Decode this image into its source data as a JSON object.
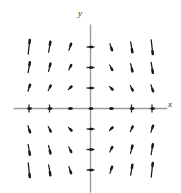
{
  "figure": {
    "kind": "direction-field",
    "background": "#ffffff",
    "axis_color": "#9a9a9a",
    "tick_color": "#2b2b2b",
    "arrow_color": "#1a1a1a"
  },
  "axes": {
    "x_label": "x",
    "y_label": "y",
    "x_label_position": "right-end-of-x-axis",
    "y_label_position": "top-of-y-axis"
  },
  "chart_data": {
    "type": "scatter",
    "title": "",
    "xlabel": "x",
    "ylabel": "y",
    "xlim": [
      -3.6,
      3.6
    ],
    "ylim": [
      -3.6,
      3.6
    ],
    "grid": false,
    "legend": null,
    "field_equation": "dy/dx = -x*y",
    "x": [
      -3,
      -2,
      -1,
      0,
      1,
      2,
      3
    ],
    "y": [
      3,
      2,
      1,
      0,
      -1,
      -2,
      -3
    ],
    "x_ticks": [
      -3,
      -2,
      -1,
      0,
      1,
      2,
      3
    ],
    "y_ticks": [
      -3,
      -2,
      -1,
      0,
      1,
      2,
      3
    ],
    "major_ticks_x": [
      -3,
      -2,
      2,
      3
    ],
    "minor_dot_ticks_x": [
      -1,
      0,
      1
    ],
    "major_ticks_y": [
      -3,
      -2,
      -1,
      1,
      2,
      3
    ],
    "vectors": [
      {
        "x": -3,
        "y": 3,
        "u": 1,
        "v": 9
      },
      {
        "x": -2,
        "y": 3,
        "u": 1,
        "v": 6
      },
      {
        "x": -1,
        "y": 3,
        "u": 1,
        "v": 3
      },
      {
        "x": 0,
        "y": 3,
        "u": 1,
        "v": 0
      },
      {
        "x": 1,
        "y": 3,
        "u": 1,
        "v": -3
      },
      {
        "x": 2,
        "y": 3,
        "u": 1,
        "v": -6
      },
      {
        "x": 3,
        "y": 3,
        "u": 1,
        "v": -9
      },
      {
        "x": -3,
        "y": 2,
        "u": 1,
        "v": 6
      },
      {
        "x": -2,
        "y": 2,
        "u": 1,
        "v": 4
      },
      {
        "x": -1,
        "y": 2,
        "u": 1,
        "v": 2
      },
      {
        "x": 0,
        "y": 2,
        "u": 1,
        "v": 0
      },
      {
        "x": 1,
        "y": 2,
        "u": 1,
        "v": -2
      },
      {
        "x": 2,
        "y": 2,
        "u": 1,
        "v": -4
      },
      {
        "x": 3,
        "y": 2,
        "u": 1,
        "v": -6
      },
      {
        "x": -3,
        "y": 1,
        "u": 1,
        "v": 3
      },
      {
        "x": -2,
        "y": 1,
        "u": 1,
        "v": 2
      },
      {
        "x": -1,
        "y": 1,
        "u": 1,
        "v": 1
      },
      {
        "x": 0,
        "y": 1,
        "u": 1,
        "v": 0
      },
      {
        "x": 1,
        "y": 1,
        "u": 1,
        "v": -1
      },
      {
        "x": 2,
        "y": 1,
        "u": 1,
        "v": -2
      },
      {
        "x": 3,
        "y": 1,
        "u": 1,
        "v": -3
      },
      {
        "x": -3,
        "y": 0,
        "u": 1,
        "v": 0
      },
      {
        "x": -2,
        "y": 0,
        "u": 1,
        "v": 0
      },
      {
        "x": -1,
        "y": 0,
        "u": 1,
        "v": 0
      },
      {
        "x": 0,
        "y": 0,
        "u": 1,
        "v": 0
      },
      {
        "x": 1,
        "y": 0,
        "u": 1,
        "v": 0
      },
      {
        "x": 2,
        "y": 0,
        "u": 1,
        "v": 0
      },
      {
        "x": 3,
        "y": 0,
        "u": 1,
        "v": 0
      },
      {
        "x": -3,
        "y": -1,
        "u": 1,
        "v": -3
      },
      {
        "x": -2,
        "y": -1,
        "u": 1,
        "v": -2
      },
      {
        "x": -1,
        "y": -1,
        "u": 1,
        "v": -1
      },
      {
        "x": 0,
        "y": -1,
        "u": 1,
        "v": 0
      },
      {
        "x": 1,
        "y": -1,
        "u": 1,
        "v": 1
      },
      {
        "x": 2,
        "y": -1,
        "u": 1,
        "v": 2
      },
      {
        "x": 3,
        "y": -1,
        "u": 1,
        "v": 3
      },
      {
        "x": -3,
        "y": -2,
        "u": 1,
        "v": -6
      },
      {
        "x": -2,
        "y": -2,
        "u": 1,
        "v": -4
      },
      {
        "x": -1,
        "y": -2,
        "u": 1,
        "v": -2
      },
      {
        "x": 0,
        "y": -2,
        "u": 1,
        "v": 0
      },
      {
        "x": 1,
        "y": -2,
        "u": 1,
        "v": 2
      },
      {
        "x": 2,
        "y": -2,
        "u": 1,
        "v": 4
      },
      {
        "x": 3,
        "y": -2,
        "u": 1,
        "v": 6
      },
      {
        "x": -3,
        "y": -3,
        "u": 1,
        "v": -9
      },
      {
        "x": -2,
        "y": -3,
        "u": 1,
        "v": -6
      },
      {
        "x": -1,
        "y": -3,
        "u": 1,
        "v": -3
      },
      {
        "x": 0,
        "y": -3,
        "u": 1,
        "v": 0
      },
      {
        "x": 1,
        "y": -3,
        "u": 1,
        "v": 3
      },
      {
        "x": 2,
        "y": -3,
        "u": 1,
        "v": 6
      },
      {
        "x": 3,
        "y": -3,
        "u": 1,
        "v": 9
      }
    ]
  }
}
